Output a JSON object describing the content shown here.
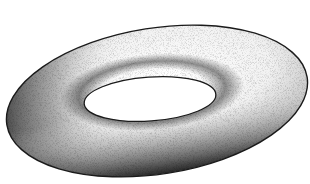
{
  "image": {
    "subject": "torus",
    "style": "stippled grayscale illustration",
    "width": 310,
    "height": 184,
    "background": "#ffffff"
  },
  "torus": {
    "outer": {
      "cx": 157,
      "cy": 101,
      "rx": 152,
      "ry": 73,
      "rotate": -9
    },
    "hole": {
      "cx": 150,
      "cy": 99,
      "rx": 66,
      "ry": 22,
      "rotate": -4
    },
    "colors": {
      "outline": "#1a1a1a",
      "highlight": "#ffffff",
      "midtone": "#b8b8b8",
      "shadow": "#3c3c3c",
      "hole_fill": "#ffffff"
    }
  },
  "caption": "Stippled illustration of a torus"
}
